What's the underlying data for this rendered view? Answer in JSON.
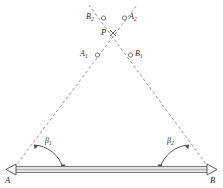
{
  "figure": {
    "type": "surveying-triangulation-diagram",
    "title": "",
    "baseline": {
      "left_endpoint_label": "A",
      "right_endpoint_label": "B",
      "left_marker": "left-triangle-support",
      "right_marker": "right-triangle-support",
      "beam_color": "#8c8c8c",
      "beam_fill": "#e8e8e8",
      "x1": 12,
      "y1": 170,
      "x2": 211,
      "y2": 170
    },
    "intersection": {
      "label": "P",
      "marker": "cross-marker",
      "x": 113,
      "y": 33
    },
    "sight_lines": [
      {
        "name": "line-from-A",
        "from": "A",
        "x1": 14,
        "y1": 168,
        "x2": 137,
        "y2": 6,
        "style": "dashed",
        "color": "#8a8a8a"
      },
      {
        "name": "line-from-B",
        "from": "B",
        "x1": 209,
        "y1": 168,
        "x2": 90,
        "y2": 6,
        "style": "dashed",
        "color": "#8a8a8a"
      }
    ],
    "points": [
      {
        "id": "A1",
        "label": "A",
        "sub": "1",
        "marker": "circle",
        "cx": 97.5,
        "cy": 55,
        "label_side": "left"
      },
      {
        "id": "B1",
        "label": "B",
        "sub": "1",
        "marker": "circle",
        "cx": 130.5,
        "cy": 55,
        "label_side": "right"
      },
      {
        "id": "B2",
        "label": "B",
        "sub": "2",
        "marker": "circle",
        "cx": 103.5,
        "cy": 18,
        "label_side": "left"
      },
      {
        "id": "A2",
        "label": "A",
        "sub": "2",
        "marker": "circle",
        "cx": 124.5,
        "cy": 18,
        "label_side": "right"
      }
    ],
    "angles": [
      {
        "id": "beta1",
        "label": "β",
        "sub": "1",
        "vertex": "A",
        "x": 47,
        "y": 142,
        "arc": "angle-arc-left"
      },
      {
        "id": "beta2",
        "label": "β",
        "sub": "2",
        "vertex": "B",
        "x": 169,
        "y": 142,
        "arc": "angle-arc-right"
      }
    ],
    "colors": {
      "line": "#8a8a8a",
      "text": "#2b2b2b",
      "beam_stroke": "#6f6f6f",
      "beam_fill": "#e4e4e4",
      "arc": "#4a4a4a"
    }
  }
}
